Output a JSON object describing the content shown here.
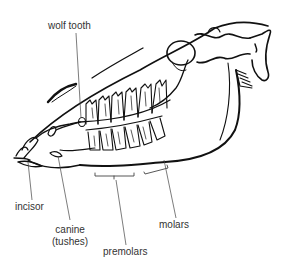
{
  "figure": {
    "labels": {
      "wolf_tooth": "wolf tooth",
      "incisor": "incisor",
      "canine_line1": "canine",
      "canine_line2": "(tushes)",
      "premolars": "premolars",
      "molars": "molars"
    },
    "colors": {
      "stroke": "#111111",
      "leader": "#444444",
      "text": "#333333",
      "background": "#ffffff"
    }
  }
}
